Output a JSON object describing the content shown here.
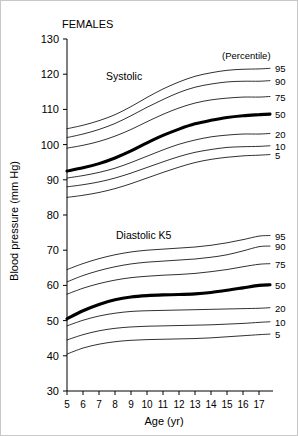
{
  "figure": {
    "title": "FEMALES",
    "xlabel": "Age (yr)",
    "ylabel": "Blood pressure (mm Hg)",
    "legend_header": "(Percentile)",
    "annotations": {
      "systolic": "Systolic",
      "diastolic": "Diastolic K5"
    }
  },
  "chart_data": {
    "type": "line",
    "title": "FEMALES",
    "subtitle": "",
    "xlabel": "Age (yr)",
    "ylabel": "Blood pressure (mm Hg)",
    "xlim": [
      5,
      17
    ],
    "ylim": [
      30,
      130
    ],
    "grid": false,
    "legend_position": "right-outside",
    "legend_title": "(Percentile)",
    "xticks": [
      5,
      6,
      7,
      8,
      9,
      10,
      11,
      12,
      13,
      14,
      15,
      16,
      17
    ],
    "xticklabels": [
      "5",
      "6",
      "7",
      "8",
      "9",
      "10",
      "11",
      "12",
      "13",
      "14",
      "15",
      "16",
      "17"
    ],
    "yticks": [
      30,
      40,
      50,
      60,
      70,
      80,
      90,
      100,
      110,
      120,
      130
    ],
    "yticklabels": [
      "30",
      "40",
      "50",
      "60",
      "70",
      "80",
      "90",
      "100",
      "110",
      "120",
      "130"
    ],
    "x": [
      5,
      6,
      7,
      8,
      9,
      10,
      11,
      12,
      13,
      14,
      15,
      16,
      17
    ],
    "groups": [
      {
        "name": "Systolic",
        "annotation": "Systolic",
        "series": [
          {
            "name": "95",
            "label": "95",
            "emphasis": false,
            "values": [
              104.5,
              105.5,
              106.8,
              108.5,
              110.8,
              113.4,
              115.8,
              117.8,
              119.4,
              120.4,
              121.1,
              121.4,
              121.5
            ]
          },
          {
            "name": "90",
            "label": "90",
            "emphasis": false,
            "values": [
              102.0,
              103.0,
              104.3,
              106.0,
              108.2,
              110.6,
              112.8,
              114.8,
              116.3,
              117.2,
              117.8,
              118.0,
              118.0
            ]
          },
          {
            "name": "75",
            "label": "75",
            "emphasis": false,
            "values": [
              99.0,
              99.8,
              100.9,
              102.4,
              104.3,
              106.5,
              108.6,
              110.4,
              111.8,
              112.7,
              113.2,
              113.5,
              113.5
            ]
          },
          {
            "name": "50",
            "label": "50",
            "emphasis": true,
            "values": [
              92.5,
              93.4,
              94.6,
              96.2,
              98.2,
              100.5,
              102.6,
              104.4,
              105.9,
              106.9,
              107.7,
              108.2,
              108.5
            ]
          },
          {
            "name": "20",
            "label": "20",
            "emphasis": false,
            "values": [
              90.5,
              91.2,
              92.1,
              93.3,
              94.9,
              96.7,
              98.5,
              100.1,
              101.3,
              102.2,
              102.7,
              103.0,
              103.0
            ]
          },
          {
            "name": "10",
            "label": "10",
            "emphasis": false,
            "values": [
              88.0,
              88.6,
              89.4,
              90.5,
              91.9,
              93.5,
              95.1,
              96.6,
              97.8,
              98.6,
              99.2,
              99.4,
              99.5
            ]
          },
          {
            "name": "5",
            "label": "5",
            "emphasis": false,
            "values": [
              85.0,
              85.6,
              86.4,
              87.5,
              88.9,
              90.5,
              92.1,
              93.6,
              94.9,
              95.8,
              96.4,
              96.8,
              97.0
            ]
          }
        ]
      },
      {
        "name": "Diastolic K5",
        "annotation": "Diastolic K5",
        "series": [
          {
            "name": "95",
            "label": "95",
            "emphasis": false,
            "values": [
              64.5,
              66.2,
              67.6,
              68.7,
              69.5,
              70.0,
              70.3,
              70.6,
              70.9,
              71.4,
              72.1,
              73.0,
              74.0
            ]
          },
          {
            "name": "90",
            "label": "90",
            "emphasis": false,
            "values": [
              61.0,
              62.8,
              64.2,
              65.3,
              66.1,
              66.6,
              66.9,
              67.2,
              67.5,
              68.0,
              68.7,
              69.8,
              71.0
            ]
          },
          {
            "name": "75",
            "label": "75",
            "emphasis": false,
            "values": [
              57.5,
              59.2,
              60.5,
              61.5,
              62.2,
              62.6,
              62.9,
              63.1,
              63.4,
              63.9,
              64.5,
              65.3,
              66.0
            ]
          },
          {
            "name": "50",
            "label": "50",
            "emphasis": true,
            "values": [
              50.5,
              52.8,
              54.6,
              55.9,
              56.7,
              57.1,
              57.3,
              57.4,
              57.6,
              58.0,
              58.6,
              59.3,
              60.0
            ]
          },
          {
            "name": "20",
            "label": "20",
            "emphasis": false,
            "values": [
              48.5,
              50.1,
              51.3,
              52.1,
              52.6,
              52.8,
              52.9,
              53.0,
              53.1,
              53.2,
              53.3,
              53.4,
              53.5
            ]
          },
          {
            "name": "10",
            "label": "10",
            "emphasis": false,
            "values": [
              44.5,
              46.0,
              47.1,
              47.8,
              48.2,
              48.4,
              48.5,
              48.6,
              48.7,
              48.8,
              49.0,
              49.2,
              49.5
            ]
          },
          {
            "name": "5",
            "label": "5",
            "emphasis": false,
            "values": [
              40.5,
              42.2,
              43.3,
              44.0,
              44.4,
              44.6,
              44.7,
              44.8,
              44.9,
              45.1,
              45.4,
              45.7,
              46.0
            ]
          }
        ]
      }
    ]
  }
}
